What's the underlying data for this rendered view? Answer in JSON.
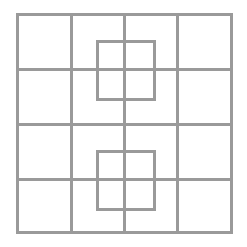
{
  "diagram": {
    "type": "grid-puzzle",
    "line_color": "#9a9a9a",
    "line_width": 3,
    "background": "#ffffff",
    "outer_grid": {
      "x0": 17,
      "y0": 14,
      "x1": 232,
      "y1": 233,
      "rows": 4,
      "cols": 4,
      "vertical_lines_x": [
        17,
        71,
        124,
        177,
        231
      ],
      "horizontal_lines_y": [
        14,
        69,
        124,
        179,
        232
      ]
    },
    "inner_squares": [
      {
        "name": "upper-inner-square",
        "x": 97,
        "y": 41,
        "width": 54,
        "height": 55
      },
      {
        "name": "lower-inner-square",
        "x": 97,
        "y": 151,
        "width": 54,
        "height": 55
      }
    ]
  }
}
